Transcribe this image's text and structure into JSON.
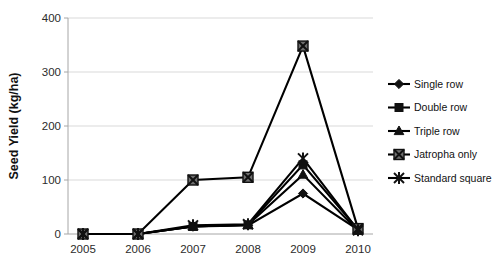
{
  "chart_data": {
    "type": "line",
    "title": "",
    "xlabel": "",
    "ylabel": "Seed Yield (kg/ha)",
    "x": [
      2005,
      2006,
      2007,
      2008,
      2009,
      2010
    ],
    "xticklabels": [
      "2005",
      "2006",
      "2007",
      "2008",
      "2009",
      "2010"
    ],
    "yticklabels": [
      "0",
      "100",
      "200",
      "300",
      "400"
    ],
    "yticks": [
      0,
      100,
      200,
      300,
      400
    ],
    "ylim": [
      0,
      400
    ],
    "grid": "horizontal",
    "legend_position": "right",
    "series": [
      {
        "name": "Single row",
        "marker": "diamond",
        "values": [
          0,
          0,
          14,
          16,
          75,
          8
        ]
      },
      {
        "name": "Double row",
        "marker": "square",
        "values": [
          0,
          0,
          14,
          17,
          128,
          8
        ]
      },
      {
        "name": "Triple row",
        "marker": "triangle",
        "values": [
          0,
          0,
          14,
          17,
          110,
          6
        ]
      },
      {
        "name": "Jatropha only",
        "marker": "x-in-square",
        "values": [
          0,
          0,
          100,
          105,
          348,
          10
        ]
      },
      {
        "name": "Standard square",
        "marker": "asterisk",
        "values": [
          0,
          0,
          16,
          18,
          140,
          7
        ]
      }
    ]
  },
  "legend": {
    "items": [
      {
        "label": "Single row"
      },
      {
        "label": "Double row"
      },
      {
        "label": "Triple row"
      },
      {
        "label": "Jatropha only"
      },
      {
        "label": "Standard square"
      }
    ]
  }
}
